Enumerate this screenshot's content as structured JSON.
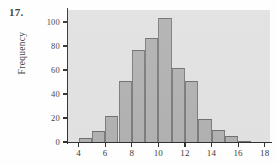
{
  "problem": {
    "number": "17."
  },
  "chart_data": {
    "type": "bar",
    "title": "",
    "subtitle": "",
    "xlabel": "",
    "ylabel": "Frequency",
    "grid": false,
    "legend": null,
    "xlim": [
      3.2,
      18.4
    ],
    "ylim": [
      0,
      110
    ],
    "x_ticks": [
      "4",
      "6",
      "8",
      "10",
      "12",
      "14",
      "16",
      "18"
    ],
    "x_tick_values": [
      4,
      6,
      8,
      10,
      12,
      14,
      16,
      18
    ],
    "y_ticks": [
      "0",
      "20",
      "40",
      "60",
      "80",
      "100"
    ],
    "y_tick_values": [
      0,
      20,
      40,
      60,
      80,
      100
    ],
    "bin_width": 1,
    "categories": [
      "4-5",
      "5-6",
      "6-7",
      "7-8",
      "8-9",
      "9-10",
      "10-11",
      "11-12",
      "12-13",
      "13-14",
      "14-15",
      "15-16",
      "16-17"
    ],
    "bin_starts": [
      4,
      5,
      6,
      7,
      8,
      9,
      10,
      11,
      12,
      13,
      14,
      15,
      16
    ],
    "values": [
      3,
      9,
      22,
      51,
      77,
      87,
      103,
      62,
      51,
      19,
      10,
      5,
      1
    ],
    "colors": {
      "bar_fill": "#a8a8a8",
      "bar_edge": "#6d6d6d",
      "plot_background": "#dedede",
      "axis": "#1a1a1a",
      "text": "#1f1f1f",
      "page_background": "#ffffff"
    }
  }
}
